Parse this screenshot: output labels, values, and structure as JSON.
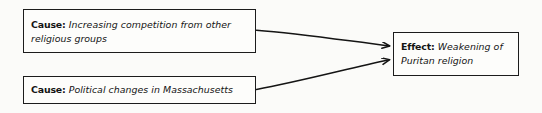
{
  "diagram": {
    "type": "cause-and-effect-flowchart",
    "style": "hand-drawn",
    "background_color": "#fbfbf9",
    "ink_color": "#141414",
    "nodes": [
      {
        "id": "cause-1",
        "label": "Cause:",
        "text": "Increasing competition from other religious groups",
        "role": "cause"
      },
      {
        "id": "cause-2",
        "label": "Cause:",
        "text": "Political changes in Massachusetts",
        "role": "cause"
      },
      {
        "id": "effect",
        "label": "Effect:",
        "text": "Weakening of Puritan religion",
        "role": "effect"
      }
    ],
    "connectors": [
      {
        "id": "arrow-cause-1-to-effect",
        "from": "cause-1",
        "to": "effect",
        "shape": "arrow"
      },
      {
        "id": "arrow-cause-2-to-effect",
        "from": "cause-2",
        "to": "effect",
        "shape": "arrow"
      }
    ]
  }
}
